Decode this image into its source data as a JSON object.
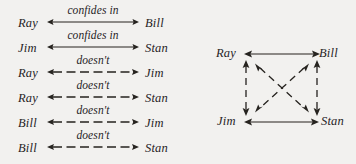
{
  "figure": {
    "kind": "relation-diagram",
    "ink_color": "#26231f",
    "background_color": "#f2f1ef",
    "relations": [
      {
        "source": "Ray",
        "label": "confides in",
        "target": "Bill",
        "style": "solid",
        "direction": "both"
      },
      {
        "source": "Jim",
        "label": "confides in",
        "target": "Stan",
        "style": "solid",
        "direction": "both"
      },
      {
        "source": "Ray",
        "label": "doesn't",
        "target": "Jim",
        "style": "dashed",
        "direction": "both"
      },
      {
        "source": "Ray",
        "label": "doesn't",
        "target": "Stan",
        "style": "dashed",
        "direction": "both"
      },
      {
        "source": "Bill",
        "label": "doesn't",
        "target": "Jim",
        "style": "dashed",
        "direction": "both"
      },
      {
        "source": "Bill",
        "label": "doesn't",
        "target": "Stan",
        "style": "dashed",
        "direction": "both"
      }
    ],
    "graph": {
      "nodes": [
        {
          "id": "ray",
          "label": "Ray",
          "position": "top-left"
        },
        {
          "id": "bill",
          "label": "Bill",
          "position": "top-right"
        },
        {
          "id": "jim",
          "label": "Jim",
          "position": "bottom-left"
        },
        {
          "id": "stan",
          "label": "Stan",
          "position": "bottom-right"
        }
      ],
      "edges": [
        {
          "from": "ray",
          "to": "bill",
          "style": "solid",
          "direction": "both",
          "shape": "horizontal"
        },
        {
          "from": "jim",
          "to": "stan",
          "style": "solid",
          "direction": "both",
          "shape": "horizontal"
        },
        {
          "from": "ray",
          "to": "jim",
          "style": "dashed",
          "direction": "both",
          "shape": "vertical"
        },
        {
          "from": "bill",
          "to": "stan",
          "style": "dashed",
          "direction": "both",
          "shape": "vertical"
        },
        {
          "from": "ray",
          "to": "stan",
          "style": "dashed",
          "direction": "both",
          "shape": "diagonal"
        },
        {
          "from": "bill",
          "to": "jim",
          "style": "dashed",
          "direction": "both",
          "shape": "diagonal"
        }
      ]
    }
  }
}
